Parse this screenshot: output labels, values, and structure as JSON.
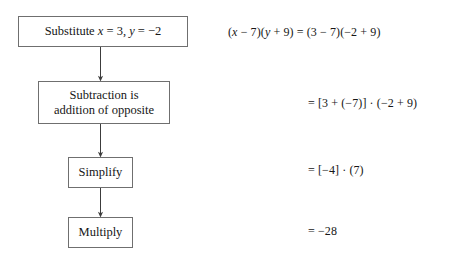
{
  "figure": {
    "background_color": "#ffffff",
    "box_border_color": "#6f6f6f",
    "text_color": "#161616",
    "connector_color": "#3c3c3c"
  },
  "flowchart": {
    "nodes": [
      {
        "id": "substitute",
        "label": "Substitute x = 3, y = -2",
        "label_parts": {
          "lead": "Substitute ",
          "var1": "x",
          "mid1": " = 3, ",
          "var2": "y",
          "mid2": " = −2"
        }
      },
      {
        "id": "subtraction",
        "label": "Subtraction is\naddition of opposite"
      },
      {
        "id": "simplify",
        "label": "Simplify"
      },
      {
        "id": "multiply",
        "label": "Multiply"
      }
    ],
    "connectors": [
      {
        "from": "substitute",
        "to": "subtraction",
        "arrowhead": true
      },
      {
        "from": "subtraction",
        "to": "simplify",
        "arrowhead": true
      },
      {
        "from": "simplify",
        "to": "multiply",
        "arrowhead": true
      }
    ]
  },
  "equations": [
    {
      "id": "equation-1",
      "text": "(x − 7)(y + 9) = (3 − 7)(−2 + 9)",
      "parts": {
        "p1": "(",
        "v1": "x",
        "p2": " − 7)(",
        "v2": "y",
        "p3": " + 9) = (3 − 7)(−2 + 9)"
      },
      "aligned_to_node": "substitute"
    },
    {
      "id": "equation-2",
      "text": "= [3 + (−7)] · (−2 + 9)",
      "aligned_to_node": "subtraction"
    },
    {
      "id": "equation-3",
      "text": "= [−4] · (7)",
      "aligned_to_node": "simplify"
    },
    {
      "id": "equation-4",
      "text": "= −28",
      "aligned_to_node": "multiply"
    }
  ]
}
